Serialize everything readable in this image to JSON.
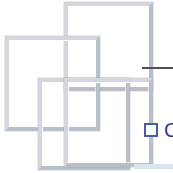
{
  "document": {
    "title": "Overlapping squares logo fragment",
    "background_color": "#ffffff"
  },
  "diagram": {
    "name": "four-overlapping-squares",
    "stroke_color": "#c8ccd4",
    "stroke_highlight": "#ffffff",
    "stroke_shadow": "#b9bfc9",
    "stroke_width_px": 4,
    "squares": [
      {
        "id": "square-top-right",
        "label": "Square 1",
        "x": 64,
        "y": 2,
        "size": 89
      },
      {
        "id": "square-left",
        "label": "Square 2",
        "x": 5,
        "y": 36,
        "size": 95
      },
      {
        "id": "square-center",
        "label": "Square 3",
        "x": 38,
        "y": 78,
        "size": 92
      },
      {
        "id": "square-bottom-right",
        "label": "Square 4",
        "x": 0,
        "y": 0,
        "size": 0
      }
    ]
  },
  "rule": {
    "name": "horizontal-divider",
    "color": "#4a4f59",
    "x": 142,
    "y": 67,
    "width": 31,
    "height": 2
  },
  "checkbox": {
    "name": "checkbox-unchecked",
    "checked": false,
    "border_color": "#4b5aa8",
    "fill_color": "#ffffff",
    "x": 144,
    "y": 123,
    "size": 14
  },
  "glyph": {
    "name": "clipped-letter",
    "text": "C",
    "color": "#2b3a8f",
    "font_size_px": 20,
    "x": 164,
    "y": 120
  },
  "band": {
    "name": "bottom-accent-band",
    "color": "#dbe4ef",
    "x": 134,
    "y": 164,
    "width": 39,
    "height": 5
  }
}
